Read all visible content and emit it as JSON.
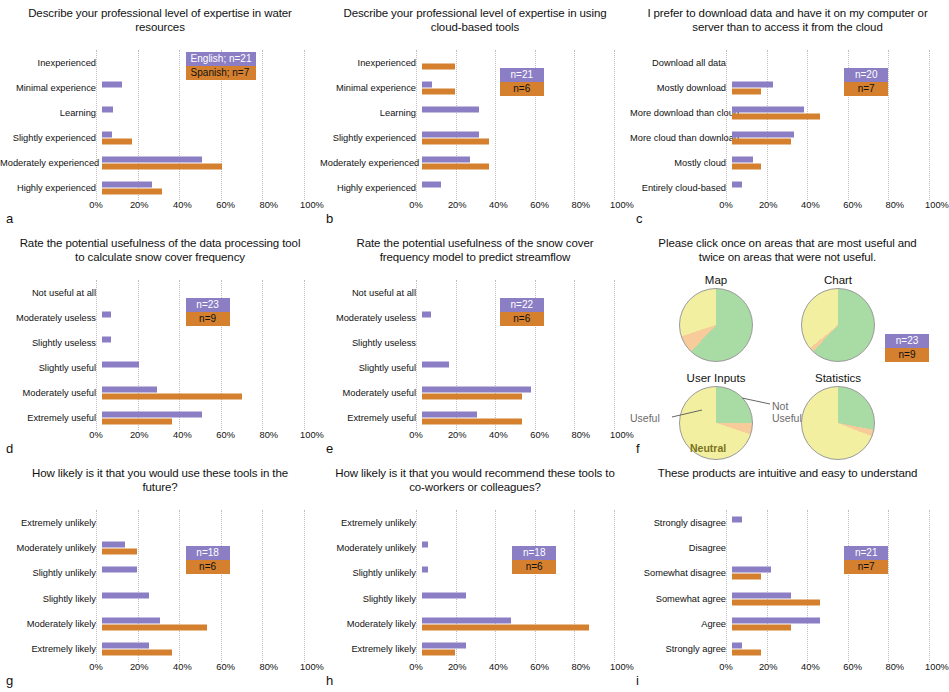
{
  "figure": {
    "colors": {
      "english_purple": "#8b7ec4",
      "spanish_orange": "#d4802e",
      "pie_useful_green": "#a9dba4",
      "pie_neutral_yellow": "#f2f0a0",
      "pie_not_useful_orange": "#f7cc9a"
    },
    "axis_ticks": [
      "0%",
      "20%",
      "40%",
      "60%",
      "80%",
      "100%"
    ]
  },
  "panels": {
    "a": {
      "letter": "a",
      "title": "Describe your professional level of expertise in water resources",
      "legend": {
        "english": "English; n=21",
        "spanish": "Spanish; n=7"
      }
    },
    "b": {
      "letter": "b",
      "title": "Describe your professional level of expertise in using cloud-based tools",
      "legend": {
        "english": "n=21",
        "spanish": "n=6"
      }
    },
    "c": {
      "letter": "c",
      "title": "I prefer to download data and have it on my computer or server than to access it from the cloud",
      "legend": {
        "english": "n=20",
        "spanish": "n=7"
      }
    },
    "d": {
      "letter": "d",
      "title": "Rate the potential usefulness of the data processing tool to calculate snow cover frequency",
      "legend": {
        "english": "n=23",
        "spanish": "n=9"
      }
    },
    "e": {
      "letter": "e",
      "title": "Rate the potential usefulness of the snow cover frequency model to predict streamflow",
      "legend": {
        "english": "n=22",
        "spanish": "n=6"
      }
    },
    "f": {
      "letter": "f",
      "title": "Please click once on areas that are most useful and twice on areas that were not useful.",
      "legend": {
        "english": "n=23",
        "spanish": "n=9"
      },
      "annotations": {
        "useful": "Useful",
        "not_useful": "Not Useful",
        "neutral": "Neutral"
      }
    },
    "g": {
      "letter": "g",
      "title": "How likely is it that you would use these tools in the future?",
      "legend": {
        "english": "n=18",
        "spanish": "n=6"
      }
    },
    "h": {
      "letter": "h",
      "title": "How likely is it that you would recommend these tools to co-workers or colleagues?",
      "legend": {
        "english": "n=18",
        "spanish": "n=6"
      }
    },
    "i": {
      "letter": "i",
      "title": "These products are intuitive and easy to understand",
      "legend": {
        "english": "n=21",
        "spanish": "n=7"
      }
    }
  },
  "chart_data": [
    {
      "id": "a",
      "type": "bar",
      "orientation": "horizontal",
      "title": "Describe your professional level of expertise in water resources",
      "xlabel": "",
      "ylabel": "",
      "xlim": [
        0,
        100
      ],
      "xticks": [
        0,
        20,
        40,
        60,
        80,
        100
      ],
      "grid": true,
      "legend_position": "upper-right",
      "categories": [
        "Inexperienced",
        "Minimal experience",
        "Learning",
        "Slightly experienced",
        "Moderately experienced",
        "Highly experienced"
      ],
      "series": [
        {
          "name": "English; n=21",
          "color": "#8b7ec4",
          "values": [
            0,
            9.5,
            5,
            4.8,
            47.6,
            23.8
          ]
        },
        {
          "name": "Spanish; n=7",
          "color": "#d4802e",
          "values": [
            0,
            0,
            0,
            14.3,
            57.1,
            28.6
          ]
        }
      ]
    },
    {
      "id": "b",
      "type": "bar",
      "orientation": "horizontal",
      "title": "Describe your professional level of expertise in using cloud-based tools",
      "xlim": [
        0,
        100
      ],
      "xticks": [
        0,
        20,
        40,
        60,
        80,
        100
      ],
      "grid": true,
      "legend_position": "upper-right",
      "categories": [
        "Inexperienced",
        "Minimal experience",
        "Learning",
        "Slightly experienced",
        "Moderately experienced",
        "Highly experienced"
      ],
      "series": [
        {
          "name": "n=21",
          "color": "#8b7ec4",
          "values": [
            0,
            4.8,
            28.6,
            28.6,
            23.8,
            9.5
          ]
        },
        {
          "name": "n=6",
          "color": "#d4802e",
          "values": [
            16.7,
            16.7,
            0,
            33.3,
            33.3,
            0
          ]
        }
      ]
    },
    {
      "id": "c",
      "type": "bar",
      "orientation": "horizontal",
      "title": "I prefer to download data and have it on my computer or server than to access it from the cloud",
      "xlim": [
        0,
        100
      ],
      "xticks": [
        0,
        20,
        40,
        60,
        80,
        100
      ],
      "grid": true,
      "legend_position": "upper-right",
      "categories": [
        "Download all data",
        "Mostly download",
        "More download than cloud",
        "More cloud than download",
        "Mostly cloud",
        "Entirely cloud-based"
      ],
      "series": [
        {
          "name": "n=20",
          "color": "#8b7ec4",
          "values": [
            0,
            20,
            35,
            30,
            10,
            5
          ]
        },
        {
          "name": "n=7",
          "color": "#d4802e",
          "values": [
            0,
            14.3,
            42.9,
            28.6,
            14.3,
            0
          ]
        }
      ]
    },
    {
      "id": "d",
      "type": "bar",
      "orientation": "horizontal",
      "title": "Rate the potential usefulness of the data processing tool to calculate snow cover frequency",
      "xlim": [
        0,
        100
      ],
      "xticks": [
        0,
        20,
        40,
        60,
        80,
        100
      ],
      "grid": true,
      "legend_position": "upper-right",
      "categories": [
        "Not useful at all",
        "Moderately useless",
        "Slightly useless",
        "Slightly useful",
        "Moderately useful",
        "Extremely useful"
      ],
      "series": [
        {
          "name": "n=23",
          "color": "#8b7ec4",
          "values": [
            0,
            4.3,
            4.3,
            17.4,
            26.1,
            47.8
          ]
        },
        {
          "name": "n=9",
          "color": "#d4802e",
          "values": [
            0,
            0,
            0,
            0,
            66.7,
            33.3
          ]
        }
      ]
    },
    {
      "id": "e",
      "type": "bar",
      "orientation": "horizontal",
      "title": "Rate the potential usefulness of the snow cover frequency model to predict streamflow",
      "xlim": [
        0,
        100
      ],
      "xticks": [
        0,
        20,
        40,
        60,
        80,
        100
      ],
      "grid": true,
      "legend_position": "upper-right",
      "categories": [
        "Not useful at all",
        "Moderately useless",
        "Slightly useless",
        "Slightly useful",
        "Moderately useful",
        "Extremely useful"
      ],
      "series": [
        {
          "name": "n=22",
          "color": "#8b7ec4",
          "values": [
            0,
            4.5,
            0,
            13.6,
            54.5,
            27.3
          ]
        },
        {
          "name": "n=6",
          "color": "#d4802e",
          "values": [
            0,
            0,
            0,
            0,
            50,
            50
          ]
        }
      ]
    },
    {
      "id": "f",
      "type": "pie",
      "title": "Please click once on areas that are most useful and twice on areas that were not useful.",
      "legend_position": "right",
      "slice_labels": [
        "Useful",
        "Not Useful",
        "Neutral"
      ],
      "pies": [
        {
          "name": "Map",
          "labels": [
            "Useful",
            "Not Useful",
            "Neutral"
          ],
          "values": [
            62,
            8,
            30
          ],
          "colors": [
            "#a9dba4",
            "#f7cc9a",
            "#f2f0a0"
          ]
        },
        {
          "name": "Chart",
          "labels": [
            "Useful",
            "Not Useful",
            "Neutral"
          ],
          "values": [
            62,
            2,
            36
          ],
          "colors": [
            "#a9dba4",
            "#f7cc9a",
            "#f2f0a0"
          ]
        },
        {
          "name": "User Inputs",
          "labels": [
            "Useful",
            "Not Useful",
            "Neutral"
          ],
          "values": [
            25,
            5,
            70
          ],
          "colors": [
            "#a9dba4",
            "#f7cc9a",
            "#f2f0a0"
          ]
        },
        {
          "name": "Statistics",
          "labels": [
            "Useful",
            "Not Useful",
            "Neutral"
          ],
          "values": [
            28,
            3,
            69
          ],
          "colors": [
            "#a9dba4",
            "#f7cc9a",
            "#f2f0a0"
          ]
        }
      ]
    },
    {
      "id": "g",
      "type": "bar",
      "orientation": "horizontal",
      "title": "How likely is it that you would use these tools in the future?",
      "xlim": [
        0,
        100
      ],
      "xticks": [
        0,
        20,
        40,
        60,
        80,
        100
      ],
      "grid": true,
      "legend_position": "upper-right",
      "categories": [
        "Extremely unlikely",
        "Moderately unlikely",
        "Slightly unlikely",
        "Slightly likely",
        "Moderately likely",
        "Extremely likely"
      ],
      "series": [
        {
          "name": "n=18",
          "color": "#8b7ec4",
          "values": [
            0,
            11.1,
            16.7,
            22.2,
            27.8,
            22.2
          ]
        },
        {
          "name": "n=6",
          "color": "#d4802e",
          "values": [
            0,
            16.7,
            0,
            0,
            50,
            33.3
          ]
        }
      ]
    },
    {
      "id": "h",
      "type": "bar",
      "orientation": "horizontal",
      "title": "How likely is it that you would recommend these tools to co-workers or colleagues?",
      "xlim": [
        0,
        100
      ],
      "xticks": [
        0,
        20,
        40,
        60,
        80,
        100
      ],
      "grid": true,
      "legend_position": "upper-right",
      "categories": [
        "Extremely unlikely",
        "Moderately unlikely",
        "Slightly unlikely",
        "Slightly likely",
        "Moderately likely",
        "Extremely likely"
      ],
      "series": [
        {
          "name": "n=18",
          "color": "#8b7ec4",
          "values": [
            0,
            2.8,
            2.8,
            22.2,
            44.4,
            22.2
          ]
        },
        {
          "name": "n=6",
          "color": "#d4802e",
          "values": [
            0,
            0,
            0,
            0,
            83.3,
            16.7
          ]
        }
      ]
    },
    {
      "id": "i",
      "type": "bar",
      "orientation": "horizontal",
      "title": "These products are intuitive and easy to understand",
      "xlim": [
        0,
        100
      ],
      "xticks": [
        0,
        20,
        40,
        60,
        80,
        100
      ],
      "grid": true,
      "legend_position": "upper-right",
      "categories": [
        "Strongly disagree",
        "Disagree",
        "Somewhat disagree",
        "Somewhat agree",
        "Agree",
        "Strongly agree"
      ],
      "series": [
        {
          "name": "n=21",
          "color": "#8b7ec4",
          "values": [
            4.8,
            0,
            19,
            28.6,
            42.9,
            4.8
          ]
        },
        {
          "name": "n=7",
          "color": "#d4802e",
          "values": [
            0,
            0,
            14.3,
            42.9,
            28.6,
            14.3
          ]
        }
      ]
    }
  ]
}
